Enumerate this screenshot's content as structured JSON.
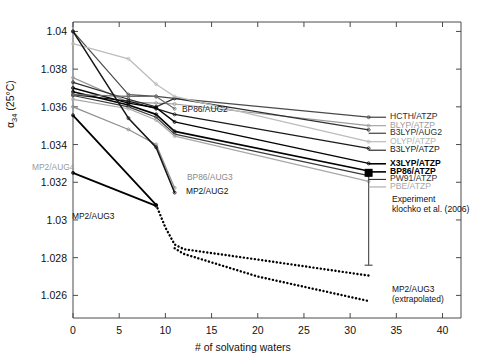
{
  "chart_data": {
    "type": "line",
    "title": "",
    "xlabel": "# of solvating waters",
    "ylabel": "α₃₄ (25°C)",
    "ylabel_base": "α",
    "ylabel_sub": "34",
    "ylabel_tail": " (25°C)",
    "xlim": [
      0,
      42
    ],
    "ylim": [
      1.0248,
      1.0405
    ],
    "grid": false,
    "legend_position": "right-inline",
    "xticks": [
      0,
      5,
      10,
      15,
      20,
      25,
      30,
      35,
      40
    ],
    "xtick_labels": [
      "0",
      "5",
      "10",
      "15",
      "20",
      "25",
      "30",
      "35",
      "40"
    ],
    "yticks": [
      1.026,
      1.028,
      1.03,
      1.032,
      1.034,
      1.036,
      1.038,
      1.04
    ],
    "ytick_labels": [
      "1.026",
      "1.028",
      "1.03",
      "1.032",
      "1.034",
      "1.036",
      "1.038",
      "1.04"
    ],
    "series": [
      {
        "name": "HCTH/ATZP",
        "color": "#4a4a4a",
        "width": 1.2,
        "style": "solid",
        "x": [
          0,
          6,
          9,
          11,
          32
        ],
        "values": [
          1.04,
          1.03665,
          1.03655,
          1.03645,
          1.03545
        ]
      },
      {
        "name": "BLYP/ATZP",
        "color": "#9a9a9a",
        "width": 1.2,
        "style": "solid",
        "x": [
          0,
          6,
          9,
          11,
          32
        ],
        "values": [
          1.03755,
          1.03625,
          1.0362,
          1.03615,
          1.035
        ]
      },
      {
        "name": "B3LYP/AUG2",
        "color": "#2f2f2f",
        "width": 1.2,
        "style": "solid",
        "x": [
          0,
          6,
          9,
          11,
          32
        ],
        "values": [
          1.0373,
          1.0364,
          1.036,
          1.03645,
          1.03478
        ]
      },
      {
        "name": "OLYP/ATZP",
        "color": "#bcbcbc",
        "width": 1.3,
        "style": "solid",
        "x": [
          0,
          6,
          9,
          11,
          32
        ],
        "values": [
          1.03935,
          1.03855,
          1.0372,
          1.03655,
          1.03415
        ]
      },
      {
        "name": "B3LYP/ATZP",
        "color": "#1a1a1a",
        "width": 1.3,
        "style": "solid",
        "x": [
          0,
          6,
          9,
          11,
          32
        ],
        "values": [
          1.03665,
          1.0363,
          1.0359,
          1.0356,
          1.0338
        ]
      },
      {
        "name": "X3LYP/ATZP",
        "color": "#000000",
        "width": 1.4,
        "style": "solid",
        "x": [
          0,
          6,
          9,
          11,
          32
        ],
        "values": [
          1.037,
          1.0362,
          1.03595,
          1.0352,
          1.033
        ]
      },
      {
        "name": "BP86/ATZP",
        "color": "#000000",
        "width": 1.6,
        "style": "solid",
        "x": [
          0,
          6,
          9,
          11,
          32
        ],
        "values": [
          1.0368,
          1.0361,
          1.0356,
          1.0347,
          1.0326
        ]
      },
      {
        "name": "PW91/ATZP",
        "color": "#3a3a3a",
        "width": 1.2,
        "style": "solid",
        "x": [
          0,
          6,
          9,
          11,
          32
        ],
        "values": [
          1.0366,
          1.036,
          1.03545,
          1.03455,
          1.03235
        ]
      },
      {
        "name": "PBE/ATZP",
        "color": "#a8a8a8",
        "width": 1.2,
        "style": "solid",
        "x": [
          0,
          6,
          9,
          11,
          32
        ],
        "values": [
          1.0364,
          1.0359,
          1.0353,
          1.03445,
          1.03205
        ]
      },
      {
        "name": "BP86/AUG2",
        "color": "#6e6e6e",
        "width": 1.2,
        "style": "solid",
        "x": [
          0,
          6,
          9,
          11
        ],
        "values": [
          1.03665,
          1.03655,
          1.03655,
          1.0359
        ]
      },
      {
        "name": "BP86/AUG3",
        "color": "#8e8e8e",
        "width": 1.2,
        "style": "solid",
        "x": [
          0,
          6,
          9,
          11
        ],
        "values": [
          1.036,
          1.0348,
          1.034,
          1.0317
        ]
      },
      {
        "name": "MP2/AUG2",
        "color": "#151515",
        "width": 1.5,
        "style": "solid",
        "x": [
          0,
          6,
          9,
          11
        ],
        "values": [
          1.04,
          1.0354,
          1.03385,
          1.03145
        ]
      },
      {
        "name": "MP2/AUG4",
        "color": "#000000",
        "width": 1.8,
        "style": "solid",
        "x": [
          0,
          9
        ],
        "values": [
          1.03555,
          1.0308
        ]
      },
      {
        "name": "MP2/AUG3",
        "color": "#000000",
        "width": 1.8,
        "style": "solid",
        "x": [
          0,
          9
        ],
        "values": [
          1.0325,
          1.03075
        ]
      },
      {
        "name": "MP2/AUG3 (extrapolated) upper",
        "color": "#000000",
        "width": 2.0,
        "style": "dotted",
        "x": [
          9,
          10,
          11,
          12,
          20,
          32
        ],
        "values": [
          1.0308,
          1.0296,
          1.0287,
          1.02845,
          1.0279,
          1.02705
        ]
      },
      {
        "name": "MP2/AUG3 (extrapolated) lower",
        "color": "#000000",
        "width": 2.0,
        "style": "dotted",
        "x": [
          11,
          12,
          20,
          32
        ],
        "values": [
          1.0285,
          1.0282,
          1.027,
          1.0257
        ]
      }
    ],
    "experiment": {
      "label_line1": "Experiment",
      "label_line2": "klochko et al. (2006)",
      "x": 32,
      "value": 1.0325,
      "err_low": 1.0276,
      "err_high": 1.0325,
      "marker": "square",
      "color": "#000000"
    },
    "legend_entries": [
      {
        "label": "HCTH/ATZP",
        "color": "#2e2e2e",
        "bold": false,
        "y": 1.03545
      },
      {
        "label": "BLYP/ATZP",
        "color": "#9e9e9e",
        "bold": false,
        "y": 1.035
      },
      {
        "label": "B3LYP/AUG2",
        "color": "#2e2e2e",
        "bold": false,
        "y": 1.0346
      },
      {
        "label": "OLYP/ATZP",
        "color": "#b4b4b4",
        "bold": false,
        "y": 1.03415
      },
      {
        "label": "B3LYP/ATZP",
        "color": "#1a1a1a",
        "bold": false,
        "y": 1.0337
      },
      {
        "label": "X3LYP/ATZP",
        "color": "#000000",
        "bold": true,
        "y": 1.03298
      },
      {
        "label": "BP86/ATZP",
        "color": "#000000",
        "bold": true,
        "y": 1.03255
      },
      {
        "label": "PW91/ATZP",
        "color": "#333333",
        "bold": false,
        "y": 1.03215
      },
      {
        "label": "PBE/ATZP",
        "color": "#a8a8a8",
        "bold": false,
        "y": 1.03175
      }
    ],
    "inline_annotations": [
      {
        "label": "BP86/AUG2",
        "color": "#1a1a1a",
        "x_px": 182,
        "y_px": 104,
        "anchor": "start"
      },
      {
        "label": "BP86/AUG3",
        "color": "#8a8a8a",
        "x_px": 187,
        "y_px": 172,
        "anchor": "start"
      },
      {
        "label": "MP2/AUG2",
        "color": "#111111",
        "x_px": 186,
        "y_px": 186,
        "anchor": "start"
      },
      {
        "label": "MP2/AUG4",
        "color": "#9a9a9a",
        "x_px": 32,
        "y_px": 162,
        "anchor": "start"
      },
      {
        "label": "MP2/AUG3",
        "color": "#111111",
        "x_px": 72,
        "y_px": 211,
        "anchor": "start"
      },
      {
        "label": "MP2/AUG3",
        "color": "#111111",
        "x_px": 392,
        "y_px": 284,
        "anchor": "start"
      },
      {
        "label": "(extrapolated)",
        "color": "#111111",
        "x_px": 392,
        "y_px": 294,
        "anchor": "start"
      }
    ]
  }
}
